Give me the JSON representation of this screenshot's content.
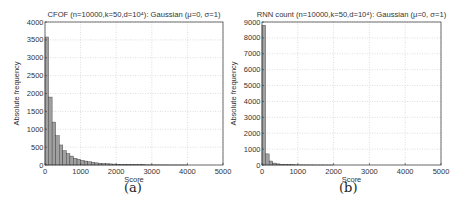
{
  "chart_data": [
    {
      "type": "bar",
      "title": "CFOF (n=10000,k=50,d=10⁴): Gaussian (μ=0, σ=1)",
      "xlabel": "Score",
      "ylabel": "Absolute frequency",
      "xlim": [
        0,
        5000
      ],
      "ylim": [
        0,
        4000
      ],
      "xticks": [
        0,
        1000,
        2000,
        3000,
        4000,
        5000
      ],
      "yticks": [
        0,
        500,
        1000,
        1500,
        2000,
        2500,
        3000,
        3500,
        4000
      ],
      "grid": true,
      "bin_width": 100,
      "values": [
        3580,
        1900,
        1200,
        820,
        560,
        400,
        320,
        250,
        190,
        160,
        130,
        110,
        90,
        75,
        60,
        50,
        40,
        35,
        30,
        25,
        20,
        18,
        15,
        12,
        10,
        8,
        7,
        6,
        5,
        4,
        3,
        3,
        2,
        2,
        2,
        1,
        1,
        1,
        1,
        1
      ],
      "caption": "(a)"
    },
    {
      "type": "bar",
      "title": "RNN count (n=10000,k=50,d=10⁴): Gaussian (μ=0, σ=1)",
      "xlabel": "Score",
      "ylabel": "Absolute frequency",
      "xlim": [
        0,
        5000
      ],
      "ylim": [
        0,
        9000
      ],
      "xticks": [
        0,
        1000,
        2000,
        3000,
        4000,
        5000
      ],
      "yticks": [
        0,
        1000,
        2000,
        3000,
        4000,
        5000,
        6000,
        7000,
        8000,
        9000
      ],
      "grid": true,
      "bin_width": 100,
      "values": [
        8800,
        700,
        250,
        120,
        70,
        45,
        30,
        20,
        15,
        10,
        8,
        6,
        5,
        4,
        3,
        2,
        2,
        1,
        1,
        1
      ],
      "caption": "(b)"
    }
  ],
  "panels": [
    {
      "caption": "(a)"
    },
    {
      "caption": "(b)"
    }
  ]
}
